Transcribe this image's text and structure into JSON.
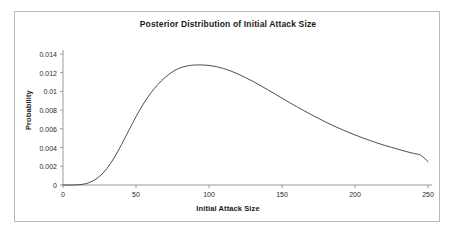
{
  "chart_data": {
    "type": "line",
    "title": "Posterior Distribution of Initial Attack Size",
    "xlabel": "Initial Attack Size",
    "ylabel": "Probability",
    "xlim": [
      0,
      250
    ],
    "ylim": [
      0,
      0.014
    ],
    "grid": false,
    "legend": null,
    "xticks": [
      0,
      50,
      100,
      150,
      200,
      250
    ],
    "xtick_labels": [
      "0",
      "50",
      "100",
      "150",
      "200",
      "250"
    ],
    "yticks": [
      0,
      0.002,
      0.004,
      0.006,
      0.008,
      0.01,
      0.012,
      0.014
    ],
    "ytick_labels": [
      "0",
      "0.002",
      "0.004",
      "0.006",
      "0.008",
      "0.01",
      "0.012",
      "0.014"
    ],
    "line_color": "#3a3a3a",
    "series": [
      {
        "name": "Posterior density",
        "x": [
          0,
          5,
          10,
          15,
          20,
          25,
          30,
          35,
          40,
          45,
          50,
          55,
          60,
          65,
          70,
          75,
          80,
          85,
          90,
          95,
          100,
          105,
          110,
          115,
          120,
          125,
          130,
          135,
          140,
          145,
          150,
          155,
          160,
          165,
          170,
          175,
          180,
          185,
          190,
          195,
          200,
          205,
          210,
          215,
          220,
          225,
          230,
          235,
          240,
          245,
          250
        ],
        "y": [
          0.0,
          0.0,
          2e-05,
          0.00012,
          0.0004,
          0.00092,
          0.00175,
          0.0029,
          0.0043,
          0.0058,
          0.0073,
          0.00865,
          0.0098,
          0.01075,
          0.0115,
          0.0121,
          0.0125,
          0.01272,
          0.01282,
          0.01283,
          0.01278,
          0.01265,
          0.01245,
          0.01218,
          0.01185,
          0.01148,
          0.01108,
          0.01065,
          0.0102,
          0.00975,
          0.00928,
          0.00882,
          0.00838,
          0.00795,
          0.00752,
          0.00712,
          0.00672,
          0.00635,
          0.006,
          0.00567,
          0.00535,
          0.00505,
          0.00477,
          0.0045,
          0.00425,
          0.00402,
          0.0038,
          0.00358,
          0.00338,
          0.00318,
          0.0025
        ]
      }
    ],
    "annotations": {
      "peak_x": 95,
      "peak_y": 0.01283,
      "onset_x": 12,
      "end_y": 0.0025
    }
  }
}
